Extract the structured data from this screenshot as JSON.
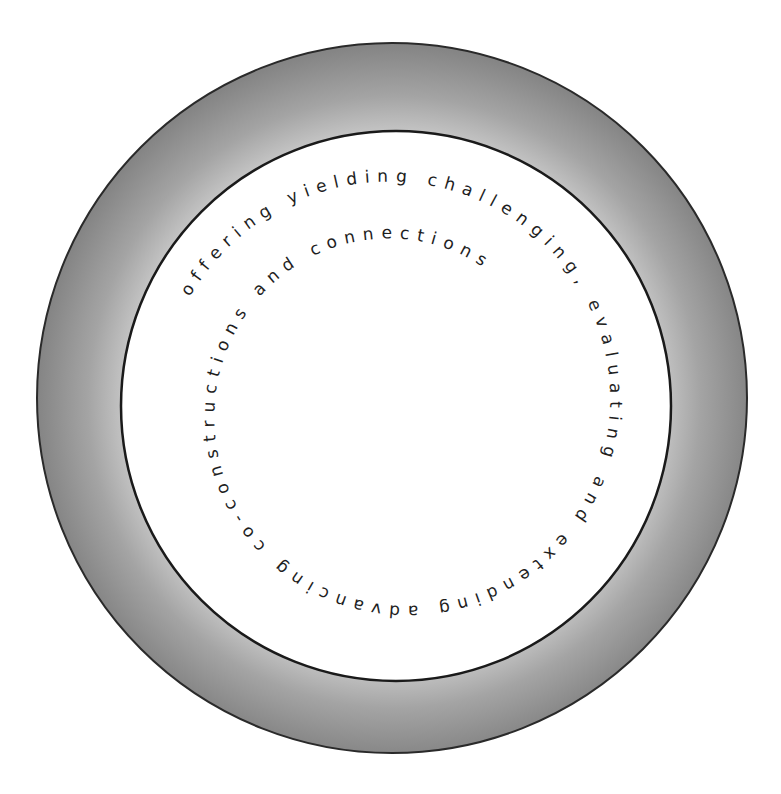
{
  "diagram": {
    "type": "concentric-ring-with-spiral-text",
    "spiral_text": "offering  yielding  challenging, evaluating and extending advancing co-constructions and connections",
    "phrases": [
      "offering",
      "yielding",
      "challenging, evaluating and extending",
      "advancing co-constructions and connections"
    ],
    "colors": {
      "background": "#ffffff",
      "ring_outer_shade": "#8a8a8a",
      "ring_inner_shade": "#bdbdbd",
      "outline": "#1a1a1a",
      "text": "#1e1e1e"
    }
  }
}
